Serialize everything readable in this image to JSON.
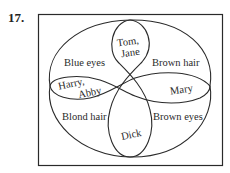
{
  "problem_number": "17.",
  "diagram": {
    "type": "venn",
    "sets": [
      {
        "name": "Blue eyes"
      },
      {
        "name": "Brown hair"
      },
      {
        "name": "Blond hair"
      },
      {
        "name": "Brown eyes"
      }
    ],
    "labels": {
      "blue_eyes": "Blue eyes",
      "brown_hair": "Brown hair",
      "blond_hair": "Blond hair",
      "brown_eyes": "Brown eyes",
      "top_region_line1": "Tom,",
      "top_region_line2": "Jane",
      "left_region_line1": "Harry,",
      "left_region_line2": "Abby",
      "right_region": "Mary",
      "bottom_region": "Dick"
    },
    "stroke_color": "#2a2a2a",
    "background": "#ffffff"
  }
}
